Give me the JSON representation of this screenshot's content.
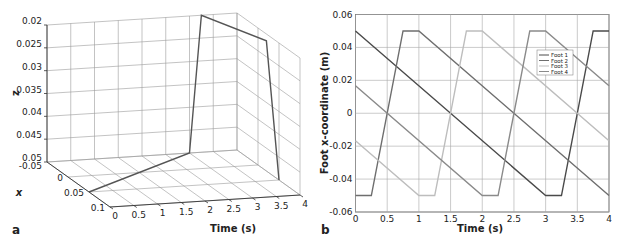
{
  "figure": {
    "panel_a_label": "a",
    "panel_b_label": "b"
  },
  "chart_data": [
    {
      "id": "a",
      "type": "line3d",
      "title": "",
      "xlabel": "x",
      "ylabel": "Time (s)",
      "zlabel": "z",
      "time_ticks": [
        "0",
        "0.5",
        "1",
        "1.5",
        "2",
        "2.5",
        "3",
        "3.5",
        "4"
      ],
      "x_ticks": [
        "-0.05",
        "0",
        "0.05",
        "0.1"
      ],
      "z_ticks": [
        "0.02",
        "0.025",
        "0.03",
        "0.035",
        "0.04",
        "0.045",
        "0.05"
      ],
      "time_range": [
        0,
        4
      ],
      "x_range": [
        -0.05,
        0.1
      ],
      "z_range": [
        0.05,
        0.02
      ],
      "z_reversed": true,
      "grid": true,
      "line_color": "#555555",
      "points": [
        {
          "t": 0,
          "x": 0.05,
          "z": 0.05
        },
        {
          "t": 3.0,
          "x": -0.05,
          "z": 0.05
        },
        {
          "t": 3.25,
          "x": -0.05,
          "z": 0.02
        },
        {
          "t": 4.0,
          "x": 0.02,
          "z": 0.0215
        },
        {
          "t": 4.0,
          "x": 0.05,
          "z": 0.05
        }
      ]
    },
    {
      "id": "b",
      "type": "line",
      "title": "",
      "xlabel": "Time (s)",
      "ylabel": "Foot x-coordinate (m)",
      "x_ticks": [
        "0",
        "0.5",
        "1",
        "1.5",
        "2",
        "2.5",
        "3",
        "3.5",
        "4"
      ],
      "y_ticks": [
        "0.06",
        "0.04",
        "0.02",
        "0",
        "-0.02",
        "-0.04",
        "-0.06"
      ],
      "xlim": [
        0,
        4
      ],
      "ylim": [
        -0.06,
        0.06
      ],
      "grid": true,
      "legend_position": "upper right",
      "series": [
        {
          "name": "Foot 1",
          "color": "#4a4a4a",
          "x": [
            0,
            3.0,
            3.25,
            3.75,
            4.0
          ],
          "y": [
            0.05,
            -0.05,
            -0.05,
            0.05,
            0.05
          ]
        },
        {
          "name": "Foot 2",
          "color": "#6e6e6e",
          "x": [
            0,
            0.25,
            0.75,
            1.0,
            4.0
          ],
          "y": [
            -0.05,
            -0.05,
            0.05,
            0.05,
            -0.05
          ]
        },
        {
          "name": "Foot 3",
          "color": "#bdbdbd",
          "x": [
            0,
            1.0,
            1.25,
            1.75,
            2.0,
            4.0
          ],
          "y": [
            -0.0167,
            -0.05,
            -0.05,
            0.05,
            0.05,
            -0.0167
          ]
        },
        {
          "name": "Foot 4",
          "color": "#8a8a8a",
          "x": [
            0,
            2.0,
            2.25,
            2.75,
            3.0,
            4.0
          ],
          "y": [
            0.0167,
            -0.05,
            -0.05,
            0.05,
            0.05,
            0.0167
          ]
        }
      ]
    }
  ]
}
